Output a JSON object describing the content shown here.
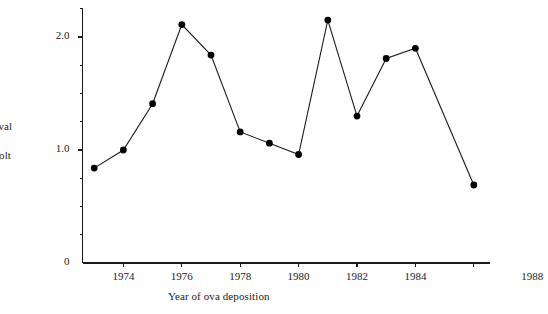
{
  "chart_data": {
    "type": "line",
    "title": "",
    "xlabel": "Year of ova deposition",
    "ylabel_line1": "rvival",
    "ylabel_line2": "smolt",
    "ylabel_note": "y-axis caption is clipped at the left edge of the image",
    "x": [
      1973,
      1974,
      1975,
      1976,
      1977,
      1978,
      1979,
      1980,
      1981,
      1982,
      1983,
      1984,
      1986
    ],
    "values": [
      0.84,
      1.0,
      1.41,
      2.11,
      1.84,
      1.16,
      1.06,
      0.96,
      2.15,
      1.3,
      1.81,
      1.9,
      0.69
    ],
    "xlim": [
      1972.5,
      1988
    ],
    "ylim": [
      0,
      2.25
    ],
    "xticks": [
      1974,
      1976,
      1978,
      1980,
      1982,
      1984,
      1988
    ],
    "xtick_labels": [
      "1974",
      "1976",
      "1978",
      "1980",
      "1982",
      "1984",
      "1988"
    ],
    "xticks_unlabeled": [
      1986
    ],
    "yticks": [
      0,
      1.0,
      2.0
    ],
    "ytick_labels": [
      "0",
      "1.0",
      "2.0"
    ],
    "yticks_minor": [
      0.25,
      0.5,
      0.75,
      1.25,
      1.5,
      1.75,
      2.25
    ],
    "grid": false,
    "legend": "none",
    "marker": "filled-circle",
    "marker_color": "#000000",
    "line_color": "#1a1a1a"
  }
}
